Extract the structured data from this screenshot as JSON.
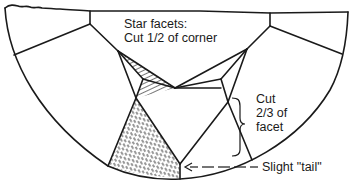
{
  "figure": {
    "colors": {
      "line": "#1a1a1a",
      "background": "#ffffff",
      "hatch": "#1a1a1a"
    }
  },
  "labels": {
    "star_facets": {
      "line1": "Star facets:",
      "line2": "Cut 1/2 of corner"
    },
    "cut_facet": {
      "line1": "Cut",
      "line2": "2/3 of",
      "line3": "facet"
    },
    "tail": {
      "text": "Slight \"tail\""
    }
  }
}
